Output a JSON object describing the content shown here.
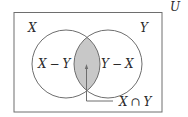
{
  "diagram": {
    "type": "venn",
    "universe_label": "U",
    "sets": [
      {
        "name": "X",
        "label": "X"
      },
      {
        "name": "Y",
        "label": "Y"
      }
    ],
    "regions": {
      "x_minus_y": {
        "var1": "X",
        "op": "−",
        "var2": "Y"
      },
      "y_minus_x": {
        "var1": "Y",
        "op": "−",
        "var2": "X"
      },
      "intersection": {
        "var1": "X",
        "op": "∩",
        "var2": "Y",
        "highlighted": true
      }
    },
    "colors": {
      "stroke": "#6e6e6e",
      "text": "#2a2a2a",
      "intersection_fill": "#c8c8c8",
      "background": "#ffffff"
    }
  }
}
